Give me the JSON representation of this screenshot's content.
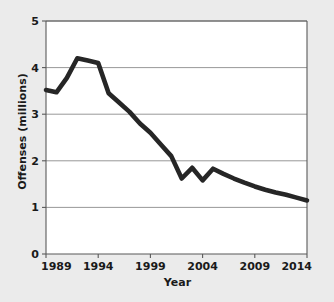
{
  "figure": {
    "background_color": "#ebebeb",
    "plot_background_color": "#ffffff",
    "line_color": "#262626",
    "grid_color": "#8c8c8c",
    "axis_color": "#595959"
  },
  "axis": {
    "xlabel": "Year",
    "ylabel": "Offenses (millions)",
    "xticks": [
      "1989",
      "1994",
      "1999",
      "2004",
      "2009",
      "2014"
    ],
    "yticks": [
      "0",
      "1",
      "2",
      "3",
      "4",
      "5"
    ]
  },
  "chart_data": {
    "type": "line",
    "title": "",
    "xlabel": "Year",
    "ylabel": "Offenses (millions)",
    "xlim": [
      1989,
      2014
    ],
    "ylim": [
      0,
      5
    ],
    "xticks": [
      1989,
      1994,
      1999,
      2004,
      2009,
      2014
    ],
    "yticks": [
      0,
      1,
      2,
      3,
      4,
      5
    ],
    "grid": "horizontal",
    "legend": "none",
    "x": [
      1989,
      1990,
      1991,
      1992,
      1993,
      1994,
      1995,
      1996,
      1997,
      1998,
      1999,
      2000,
      2001,
      2002,
      2003,
      2004,
      2005,
      2006,
      2007,
      2008,
      2009,
      2010,
      2011,
      2012,
      2013,
      2014
    ],
    "series": [
      {
        "name": "Offenses",
        "values": [
          3.52,
          3.47,
          3.78,
          4.2,
          4.15,
          4.1,
          3.45,
          3.25,
          3.05,
          2.8,
          2.6,
          2.35,
          2.1,
          1.62,
          1.85,
          1.58,
          1.83,
          1.72,
          1.62,
          1.53,
          1.45,
          1.38,
          1.32,
          1.27,
          1.21,
          1.15
        ]
      }
    ]
  }
}
